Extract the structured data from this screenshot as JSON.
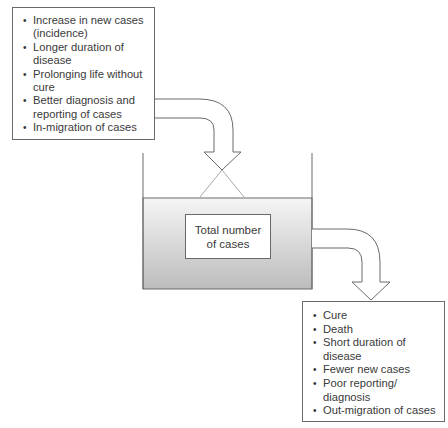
{
  "inflow": {
    "items": [
      "Increase in new cases (incidence)",
      "Longer duration of disease",
      "Prolonging life without cure",
      "Better diagnosis and reporting of cases",
      "In-migration of cases"
    ]
  },
  "reservoir": {
    "label": "Total number of cases"
  },
  "outflow": {
    "items": [
      "Cure",
      "Death",
      "Short duration of disease",
      "Fewer new cases",
      "Poor reporting/ diagnosis",
      "Out-migration of cases"
    ]
  },
  "colors": {
    "line": "#6a6a6a",
    "liquid_top": "#f4f4f4",
    "liquid_bottom": "#bdbdbd"
  }
}
